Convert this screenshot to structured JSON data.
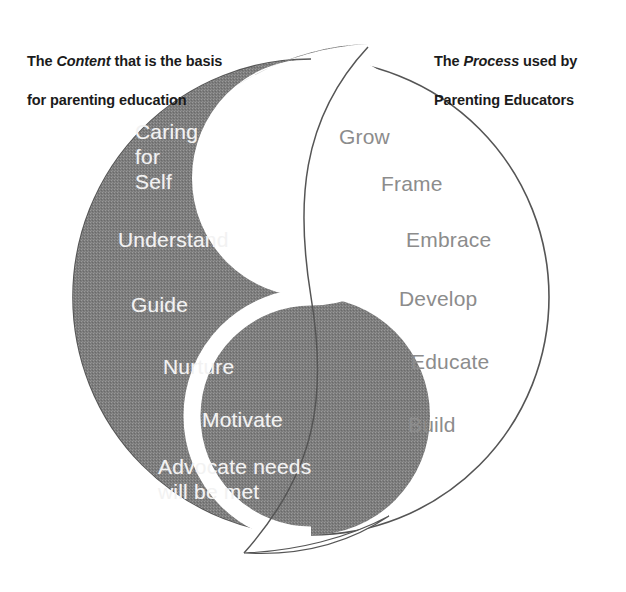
{
  "diagram": {
    "colors": {
      "dark_fill": "#808080",
      "light_fill": "#ffffff",
      "outline": "#4d4d4d",
      "dark_side_text": "#f2f2f2",
      "light_side_text": "#8c8c8c",
      "caption_text": "#1b1b1b"
    }
  },
  "captions": {
    "left": {
      "line1_before": "The ",
      "line1_emphasis": "Content",
      "line1_after": " that is the basis",
      "line2": "for parenting education"
    },
    "right": {
      "line1_before": "The ",
      "line1_emphasis": "Process",
      "line1_after": " used by",
      "line2": "Parenting Educators"
    }
  },
  "content_side": {
    "name": "Content",
    "words": [
      {
        "text": "Caring\nfor\nSelf",
        "x": 135,
        "y": 120
      },
      {
        "text": "Understand",
        "x": 118,
        "y": 228
      },
      {
        "text": "Guide",
        "x": 131,
        "y": 293
      },
      {
        "text": "Nurture",
        "x": 163,
        "y": 355
      },
      {
        "text": "Motivate",
        "x": 202,
        "y": 408
      },
      {
        "text": "Advocate needs\nwill be met",
        "x": 158,
        "y": 455
      }
    ]
  },
  "process_side": {
    "name": "Process",
    "words": [
      {
        "text": "Grow",
        "x": 339,
        "y": 125
      },
      {
        "text": "Frame",
        "x": 381,
        "y": 172
      },
      {
        "text": "Embrace",
        "x": 406,
        "y": 228
      },
      {
        "text": "Develop",
        "x": 399,
        "y": 287
      },
      {
        "text": "Educate",
        "x": 411,
        "y": 350
      },
      {
        "text": "Build",
        "x": 408,
        "y": 413
      }
    ]
  }
}
